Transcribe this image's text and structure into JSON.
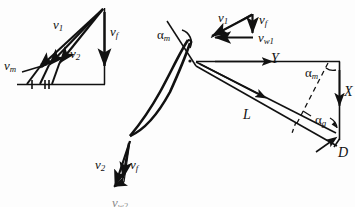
{
  "figure": {
    "background_color": "#fdfdfd",
    "stroke_color": "#111111",
    "width": 355,
    "height": 207
  },
  "inlet_triangle": {
    "name": "inlet-velocity-triangle",
    "labels": {
      "v1": {
        "base": "v",
        "sub": "1"
      },
      "v2": {
        "base": "v",
        "sub": "2"
      },
      "vf": {
        "base": "v",
        "sub": "f"
      },
      "vm": {
        "base": "v",
        "sub": "m"
      }
    },
    "tick_marks": [
      "single",
      "double"
    ]
  },
  "cascade_triangle": {
    "name": "cascade-velocity-triangle",
    "labels": {
      "v1": {
        "base": "v",
        "sub": "1"
      },
      "vf": {
        "base": "v",
        "sub": "f"
      },
      "vw1": {
        "base": "v",
        "sub": "w1"
      },
      "alpha_m": {
        "base": "α",
        "sub": "m"
      }
    }
  },
  "outlet_triangle": {
    "name": "outlet-velocity-triangle",
    "labels": {
      "v2": {
        "base": "v",
        "sub": "2"
      },
      "vf": {
        "base": "v",
        "sub": "f"
      },
      "vw2": {
        "base": "v",
        "sub": "w2"
      }
    }
  },
  "force_diagram": {
    "name": "aerodynamic-force-diagram",
    "labels": {
      "Y": {
        "base": "Y",
        "sub": ""
      },
      "X": {
        "base": "X",
        "sub": ""
      },
      "L": {
        "base": "L",
        "sub": ""
      },
      "D": {
        "base": "D",
        "sub": ""
      },
      "alpha_m": {
        "base": "α",
        "sub": "m"
      },
      "alpha_g": {
        "base": "α",
        "sub": "g"
      }
    }
  },
  "text": {
    "v1": "v",
    "v1_sub": "1",
    "v2": "v",
    "v2_sub": "2",
    "vf": "v",
    "vf_sub": "f",
    "vm": "v",
    "vm_sub": "m",
    "vw1": "v",
    "vw1_sub": "w1",
    "vw2": "v",
    "vw2_sub": "w2",
    "alpha": "α",
    "alpha_m_sub": "m",
    "alpha_g_sub": "g",
    "Y": "Y",
    "X": "X",
    "L": "L",
    "D": "D"
  }
}
